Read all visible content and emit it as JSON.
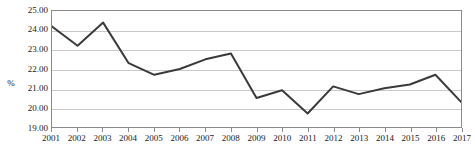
{
  "chart_data": {
    "type": "line",
    "title": "",
    "xlabel": "",
    "ylabel": "%",
    "categories": [
      "2001",
      "2002",
      "2003",
      "2004",
      "2005",
      "2006",
      "2007",
      "2008",
      "2009",
      "2010",
      "2011",
      "2012",
      "2013",
      "2014",
      "2015",
      "2016",
      "2017"
    ],
    "values": [
      24.2,
      23.2,
      24.4,
      22.3,
      21.7,
      22.0,
      22.5,
      22.8,
      20.5,
      20.9,
      19.7,
      21.1,
      20.7,
      21.0,
      21.2,
      21.7,
      20.3
    ],
    "series": [
      {
        "name": "%",
        "values": [
          24.2,
          23.2,
          24.4,
          22.3,
          21.7,
          22.0,
          22.5,
          22.8,
          20.5,
          20.9,
          19.7,
          21.1,
          20.7,
          21.0,
          21.2,
          21.7,
          20.3
        ]
      }
    ],
    "ylim": [
      19.0,
      25.0
    ],
    "ytick_values": [
      25.0,
      24.0,
      23.0,
      22.0,
      21.0,
      20.0,
      19.0
    ],
    "ytick_labels": [
      "25.00",
      "24.00",
      "23.00",
      "22.00",
      "21.00",
      "20.00",
      "19.00"
    ],
    "grid": true,
    "grid_axis": "y",
    "legend": false,
    "legend_position": "none",
    "line_color": "#3a3a3a",
    "grid_color": "#c9c9c9",
    "axis_color": "#8a8a8a",
    "background_color": "#ffffff"
  }
}
